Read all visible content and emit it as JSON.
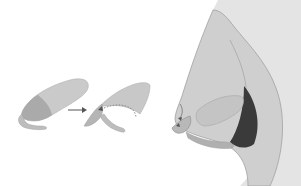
{
  "figure": {
    "colors": {
      "background": "#ffffff",
      "graft_light": "#c9c9c9",
      "graft_dark": "#a9a9a9",
      "skin": "#d4d4d4",
      "skin_shadow": "#9a9a9a",
      "cavity": "#3a3a3a",
      "outline": "#8a8a8a",
      "arrow": "#555555"
    },
    "panels": [
      {
        "id": "graft-original"
      },
      {
        "id": "transform-arrow"
      },
      {
        "id": "graft-folded"
      },
      {
        "id": "nose-profile"
      }
    ]
  }
}
